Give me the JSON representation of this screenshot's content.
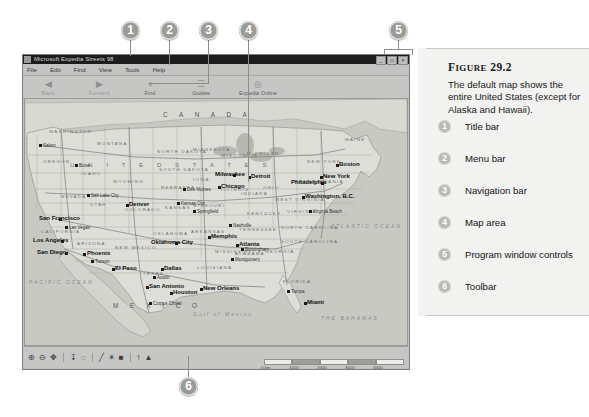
{
  "figure": {
    "label_small": "IGURE",
    "label_first": "F",
    "number": "29.2",
    "description": "The default map shows the entire United States (except for Alaska and Hawaii).",
    "legend": [
      {
        "num": "1",
        "label": "Title bar"
      },
      {
        "num": "2",
        "label": "Menu bar"
      },
      {
        "num": "3",
        "label": "Navigation bar"
      },
      {
        "num": "4",
        "label": "Map area"
      },
      {
        "num": "5",
        "label": "Program window controls"
      },
      {
        "num": "6",
        "label": "Toolbar"
      }
    ]
  },
  "callouts": [
    {
      "num": "1"
    },
    {
      "num": "2"
    },
    {
      "num": "3"
    },
    {
      "num": "4"
    },
    {
      "num": "5"
    },
    {
      "num": "6"
    }
  ],
  "app": {
    "title": "Microsoft Expedia Streets 98",
    "window_controls": [
      {
        "name": "minimize",
        "glyph": "_"
      },
      {
        "name": "maximize",
        "glyph": "□"
      },
      {
        "name": "close",
        "glyph": "×"
      }
    ],
    "menus": [
      "File",
      "Edit",
      "Find",
      "View",
      "Tools",
      "Help"
    ],
    "toolbar": [
      {
        "label": "Back",
        "icon": "◀",
        "dim": true
      },
      {
        "label": "Forward",
        "icon": "▶",
        "dim": true
      },
      {
        "label": "Find",
        "icon": "⌖",
        "dim": false
      },
      {
        "label": "Guides",
        "icon": "☰",
        "dim": false
      },
      {
        "label": "Expedia Online",
        "icon": "◎",
        "dim": false
      }
    ],
    "status_tools": [
      {
        "name": "zoom-in-icon",
        "glyph": "⊕"
      },
      {
        "name": "zoom-out-icon",
        "glyph": "⊖"
      },
      {
        "name": "pan-icon",
        "glyph": "✥"
      },
      {
        "name": "measure-icon",
        "glyph": "↧"
      },
      {
        "name": "route-icon",
        "glyph": "◌"
      },
      {
        "name": "pencil-icon",
        "glyph": "╱"
      },
      {
        "name": "highlight-icon",
        "glyph": "☀"
      },
      {
        "name": "pushpin-icon",
        "glyph": "■"
      },
      {
        "name": "locate-icon",
        "glyph": "↑"
      },
      {
        "name": "marker-icon",
        "glyph": "▲"
      }
    ],
    "scale_labels": [
      "0 km",
      "1000",
      "2000",
      "3000",
      "4000",
      "5000"
    ]
  },
  "map": {
    "countries": [
      {
        "text": "C A N A D A",
        "x": 138,
        "y": 12
      },
      {
        "text": "M E X I C O",
        "x": 88,
        "y": 203
      }
    ],
    "usa_label": {
      "text": "U N I T E D   S T A T E S",
      "x": 45,
      "y": 62
    },
    "states": [
      {
        "text": "WASHINGTON",
        "x": 24,
        "y": 30
      },
      {
        "text": "OREGON",
        "x": 18,
        "y": 60
      },
      {
        "text": "MONTANA",
        "x": 72,
        "y": 42
      },
      {
        "text": "IDAHO",
        "x": 56,
        "y": 72
      },
      {
        "text": "WYOMING",
        "x": 88,
        "y": 80
      },
      {
        "text": "NEVADA",
        "x": 36,
        "y": 95
      },
      {
        "text": "UTAH",
        "x": 65,
        "y": 103
      },
      {
        "text": "COLORADO",
        "x": 100,
        "y": 108
      },
      {
        "text": "NORTH DAKOTA",
        "x": 132,
        "y": 50
      },
      {
        "text": "SOUTH DAKOTA",
        "x": 134,
        "y": 68
      },
      {
        "text": "NEBRASKA",
        "x": 136,
        "y": 86
      },
      {
        "text": "KANSAS",
        "x": 140,
        "y": 106
      },
      {
        "text": "MINNESOTA",
        "x": 168,
        "y": 48
      },
      {
        "text": "IOWA",
        "x": 168,
        "y": 78
      },
      {
        "text": "MISSOURI",
        "x": 168,
        "y": 104
      },
      {
        "text": "CALIFORNIA",
        "x": 16,
        "y": 130
      },
      {
        "text": "ARIZONA",
        "x": 52,
        "y": 142
      },
      {
        "text": "NEW MEXICO",
        "x": 90,
        "y": 146
      },
      {
        "text": "OKLAHOMA",
        "x": 128,
        "y": 132
      },
      {
        "text": "TEXAS",
        "x": 118,
        "y": 172
      },
      {
        "text": "ARKANSAS",
        "x": 166,
        "y": 130
      },
      {
        "text": "LOUISIANA",
        "x": 172,
        "y": 166
      },
      {
        "text": "WISCONSIN",
        "x": 196,
        "y": 54
      },
      {
        "text": "MICHIGAN",
        "x": 222,
        "y": 52
      },
      {
        "text": "ILLINOIS",
        "x": 196,
        "y": 88
      },
      {
        "text": "INDIANA",
        "x": 216,
        "y": 92
      },
      {
        "text": "OHIO",
        "x": 238,
        "y": 86
      },
      {
        "text": "KENTUCKY",
        "x": 222,
        "y": 112
      },
      {
        "text": "TENNESSEE",
        "x": 214,
        "y": 128
      },
      {
        "text": "MISSISSIPPI",
        "x": 190,
        "y": 150
      },
      {
        "text": "ALABAMA",
        "x": 210,
        "y": 152
      },
      {
        "text": "GEORGIA",
        "x": 240,
        "y": 150
      },
      {
        "text": "FLORIDA",
        "x": 258,
        "y": 180
      },
      {
        "text": "NORTH CAROLINA",
        "x": 256,
        "y": 126
      },
      {
        "text": "SOUTH CAROLINA",
        "x": 256,
        "y": 140
      },
      {
        "text": "VIRGINIA",
        "x": 262,
        "y": 110
      },
      {
        "text": "WEST VIRGINIA",
        "x": 250,
        "y": 98
      },
      {
        "text": "PENNSYLVANIA",
        "x": 270,
        "y": 80
      },
      {
        "text": "NEW YORK",
        "x": 282,
        "y": 60
      },
      {
        "text": "MAINE",
        "x": 320,
        "y": 38
      }
    ],
    "cities_major": [
      {
        "text": "San Francisco",
        "x": 14,
        "y": 116,
        "dx": 34,
        "dy": 119
      },
      {
        "text": "Los Angeles",
        "x": 8,
        "y": 138,
        "dx": 36,
        "dy": 141
      },
      {
        "text": "San Diego",
        "x": 12,
        "y": 150,
        "dx": 40,
        "dy": 153
      },
      {
        "text": "Phoenix",
        "x": 62,
        "y": 151,
        "dx": 58,
        "dy": 154
      },
      {
        "text": "El Paso",
        "x": 90,
        "y": 166,
        "dx": 87,
        "dy": 169
      },
      {
        "text": "San Antonio",
        "x": 124,
        "y": 184,
        "dx": 121,
        "dy": 187
      },
      {
        "text": "Houston",
        "x": 148,
        "y": 190,
        "dx": 145,
        "dy": 193
      },
      {
        "text": "Dallas",
        "x": 139,
        "y": 166,
        "dx": 136,
        "dy": 169
      },
      {
        "text": "Oklahoma City",
        "x": 126,
        "y": 140,
        "dx": 150,
        "dy": 143
      },
      {
        "text": "New Orleans",
        "x": 178,
        "y": 186,
        "dx": 175,
        "dy": 189
      },
      {
        "text": "Memphis",
        "x": 186,
        "y": 134,
        "dx": 183,
        "dy": 137
      },
      {
        "text": "Atlanta",
        "x": 214,
        "y": 142,
        "dx": 211,
        "dy": 145
      },
      {
        "text": "Miami",
        "x": 282,
        "y": 200,
        "dx": 279,
        "dy": 203
      },
      {
        "text": "Chicago",
        "x": 196,
        "y": 84,
        "dx": 193,
        "dy": 87
      },
      {
        "text": "Milwaukee",
        "x": 190,
        "y": 72,
        "dx": 208,
        "dy": 75
      },
      {
        "text": "Detroit",
        "x": 226,
        "y": 74,
        "dx": 223,
        "dy": 77
      },
      {
        "text": "Philadelphia",
        "x": 266,
        "y": 80,
        "dx": 296,
        "dy": 83
      },
      {
        "text": "New York",
        "x": 298,
        "y": 74,
        "dx": 295,
        "dy": 77
      },
      {
        "text": "Boston",
        "x": 314,
        "y": 62,
        "dx": 311,
        "dy": 65
      },
      {
        "text": "Washington, B.C.",
        "x": 280,
        "y": 94,
        "dx": 277,
        "dy": 97
      },
      {
        "text": "Denver",
        "x": 104,
        "y": 102,
        "dx": 101,
        "dy": 105
      }
    ],
    "cities_minor": [
      {
        "text": "Salem",
        "x": 14,
        "y": 44
      },
      {
        "text": "Boise",
        "x": 50,
        "y": 64
      },
      {
        "text": "Salt Lake City",
        "x": 62,
        "y": 94
      },
      {
        "text": "Las Vegas",
        "x": 40,
        "y": 126
      },
      {
        "text": "Tucson",
        "x": 66,
        "y": 160
      },
      {
        "text": "Austin",
        "x": 128,
        "y": 176
      },
      {
        "text": "Corpus Christi",
        "x": 124,
        "y": 202
      },
      {
        "text": "Springfield",
        "x": 168,
        "y": 110
      },
      {
        "text": "Des Moines",
        "x": 158,
        "y": 88
      },
      {
        "text": "Kansas City",
        "x": 152,
        "y": 102
      },
      {
        "text": "Montgomery",
        "x": 206,
        "y": 158
      },
      {
        "text": "Birmingham",
        "x": 216,
        "y": 148
      },
      {
        "text": "Nashville",
        "x": 204,
        "y": 124
      },
      {
        "text": "Tampa",
        "x": 262,
        "y": 190
      },
      {
        "text": "Virginia Beach",
        "x": 284,
        "y": 110
      }
    ],
    "waters": [
      {
        "text": "Gulf of Mexico",
        "x": 168,
        "y": 212
      },
      {
        "text": "PACIFIC OCEAN",
        "x": 4,
        "y": 180
      },
      {
        "text": "ATLANTIC OCEAN",
        "x": 306,
        "y": 124
      },
      {
        "text": "THE BAHAMAS",
        "x": 296,
        "y": 216
      }
    ]
  }
}
